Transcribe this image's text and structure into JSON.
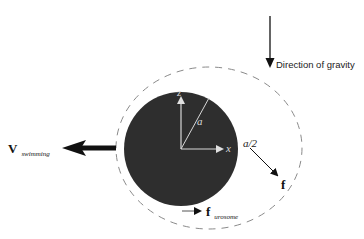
{
  "gravity": {
    "label": "Direction of gravity"
  },
  "body": {
    "radius_label": "a",
    "axis_z_label": "z",
    "axis_x_label": "x"
  },
  "shell": {
    "gap_label": "a/2"
  },
  "forces": {
    "f_label": "f",
    "urosome_main": "f",
    "urosome_sub": "urosome"
  },
  "velocity": {
    "main": "V",
    "sub": "swimming"
  },
  "colors": {
    "body_fill": "#2e2e2e",
    "dash": "#8a8a8a",
    "ink": "#111111",
    "axis": "#d8d8d8"
  }
}
